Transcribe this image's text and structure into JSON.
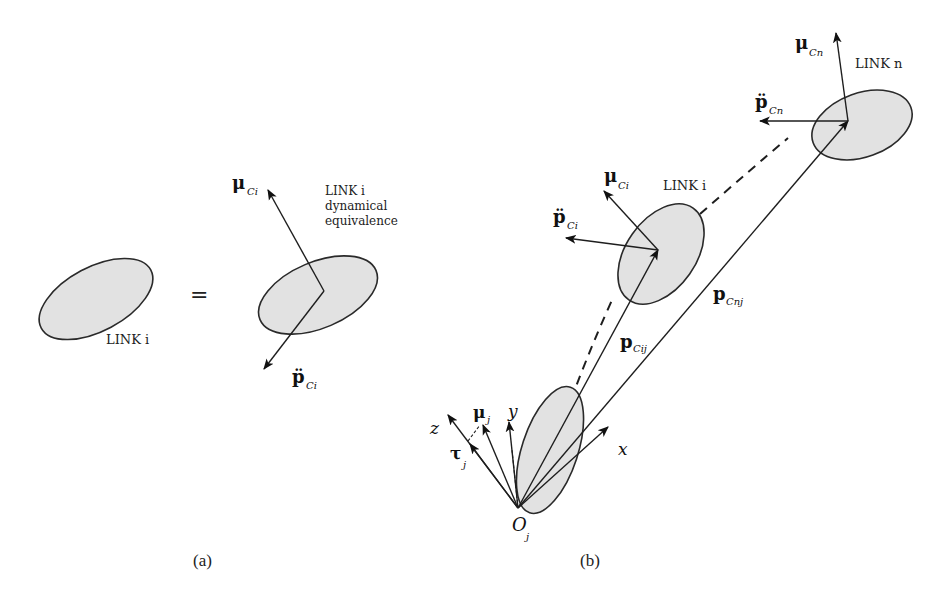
{
  "figure": {
    "panel_a": {
      "caption": "(a)",
      "left_link_label": "LINK i",
      "equals": "=",
      "right_link_label_line1": "LINK i",
      "right_link_label_line2": "dynamical",
      "right_link_label_line3": "equivalence",
      "moment_label": "μ",
      "moment_sub": "Ci",
      "accel_label": "p̈",
      "accel_sub": "Ci"
    },
    "panel_b": {
      "caption": "(b)",
      "link_i": {
        "label": "LINK i",
        "moment_label": "μ",
        "moment_sub": "Ci",
        "accel_label": "p̈",
        "accel_sub": "Ci"
      },
      "link_n": {
        "label": "LINK n",
        "moment_label": "μ",
        "moment_sub": "Cn",
        "accel_label": "p̈",
        "accel_sub": "Cn"
      },
      "position_vectors": [
        {
          "label": "p",
          "sub": "Cij"
        },
        {
          "label": "p",
          "sub": "Cnj"
        }
      ],
      "base": {
        "origin_label": "O",
        "origin_sub": "j",
        "axis_x": "x",
        "axis_y": "y",
        "axis_z": "z",
        "moment_label": "μ",
        "moment_sub": "j",
        "torque_label": "τ",
        "torque_sub": "j"
      }
    }
  }
}
